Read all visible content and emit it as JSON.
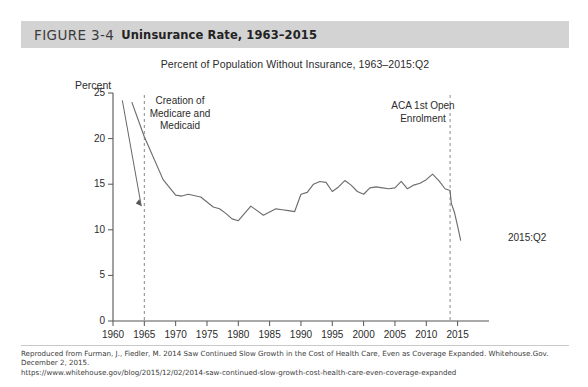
{
  "header": {
    "figure_label": "FIGURE 3-4",
    "figure_title": "Uninsurance Rate, 1963–2015",
    "band_color": "#d3d3d3"
  },
  "footer": {
    "line1": "Reproduced from Furman, J., Fiedler, M. 2014 Saw Continued Slow Growth in the Cost of Health Care, Even as Coverage Expanded. Whitehouse.Gov. December 2, 2015.",
    "line2": "https://www.whitehouse.gov/blog/2015/12/02/2014-saw-continued-slow-growth-cost-health-care-even-coverage-expanded"
  },
  "chart_data": {
    "type": "line",
    "title": "Percent of Population Without Insurance, 1963–2015:Q2",
    "xlabel": "",
    "ylabel": "Percent",
    "ylabel_position": "above-axis",
    "xlim": [
      1960,
      2016.5
    ],
    "ylim": [
      0,
      25
    ],
    "grid": false,
    "legend": null,
    "line_color": "#6d6d6d",
    "xticks": [
      1960,
      1965,
      1970,
      1975,
      1980,
      1985,
      1990,
      1995,
      2000,
      2005,
      2010,
      2015
    ],
    "xtick_labels": [
      "1960",
      "1965",
      "1970",
      "1975",
      "1980",
      "1985",
      "1990",
      "1995",
      "2000",
      "2005",
      "2010",
      "2015"
    ],
    "yticks": [
      0,
      5,
      10,
      15,
      20,
      25
    ],
    "ytick_labels": [
      "0",
      "5",
      "10",
      "15",
      "20",
      "25"
    ],
    "series": [
      {
        "name": "Percent of population without insurance",
        "x": [
          1963,
          1965,
          1968,
          1970,
          1971,
          1972,
          1974,
          1976,
          1977,
          1978,
          1979,
          1980,
          1982,
          1984,
          1986,
          1987,
          1988,
          1989,
          1990,
          1991,
          1992,
          1993,
          1994,
          1995,
          1996,
          1997,
          1998,
          1999,
          2000,
          2001,
          2002,
          2003,
          2004,
          2005,
          2006,
          2007,
          2008,
          2009,
          2010,
          2011,
          2012,
          2013,
          2013.8,
          2014,
          2014.5,
          2015,
          2015.5
        ],
        "y": [
          24.0,
          20.2,
          15.5,
          13.8,
          13.7,
          13.9,
          13.6,
          12.5,
          12.3,
          11.8,
          11.2,
          11.0,
          12.6,
          11.6,
          12.3,
          12.2,
          12.1,
          12.0,
          13.9,
          14.1,
          15.0,
          15.3,
          15.2,
          14.2,
          14.7,
          15.4,
          14.9,
          14.2,
          13.9,
          14.6,
          14.7,
          14.6,
          14.5,
          14.6,
          15.3,
          14.5,
          14.9,
          15.1,
          15.5,
          16.1,
          15.4,
          14.5,
          14.3,
          12.9,
          11.9,
          10.4,
          8.8
        ]
      }
    ],
    "annotations": [
      {
        "name": "medicare-medicaid",
        "text": "Creation of\nMedicare and\nMedicaid",
        "vline_x": 1965,
        "arrow": true
      },
      {
        "name": "aca-open-enrolment",
        "text": "ACA 1st Open\nEnrolment",
        "vline_x": 2013.8,
        "arrow": false
      },
      {
        "name": "end-point-label",
        "text": "2015:Q2",
        "x": 2016,
        "y": 6.5
      }
    ]
  }
}
